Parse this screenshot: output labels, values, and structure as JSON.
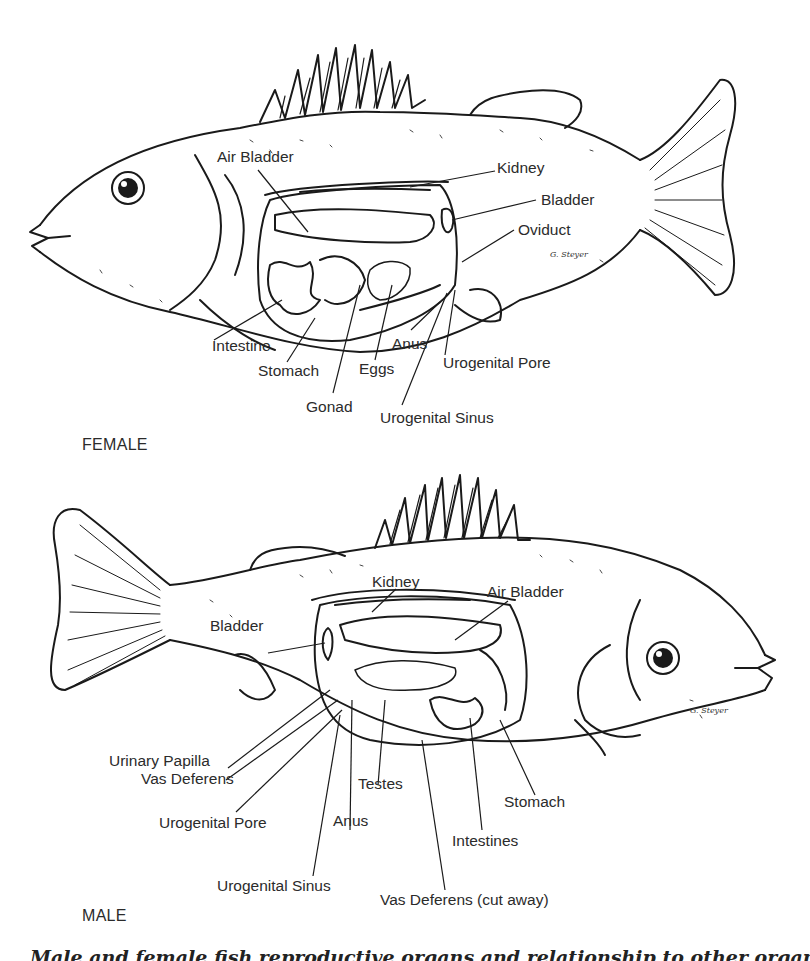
{
  "female": {
    "title": "FEMALE",
    "labels": {
      "air_bladder": "Air Bladder",
      "kidney": "Kidney",
      "bladder": "Bladder",
      "oviduct": "Oviduct",
      "intestine": "Intestine",
      "stomach": "Stomach",
      "eggs": "Eggs",
      "anus": "Anus",
      "urogenital_pore": "Urogenital Pore",
      "gonad": "Gonad",
      "urogenital_sinus": "Urogenital Sinus"
    },
    "signature": "G. Steyer"
  },
  "male": {
    "title": "MALE",
    "labels": {
      "kidney": "Kidney",
      "air_bladder": "Air Bladder",
      "bladder": "Bladder",
      "urinary_papilla": "Urinary Papilla",
      "vas_deferens": "Vas Deferens",
      "testes": "Testes",
      "stomach": "Stomach",
      "urogenital_pore": "Urogenital Pore",
      "anus": "Anus",
      "intestines": "Intestines",
      "urogenital_sinus": "Urogenital Sinus",
      "vas_deferens_cut": "Vas Deferens (cut away)"
    },
    "signature": "G. Steyer"
  },
  "caption": "Male and female fish reproductive organs and relationship to other organs"
}
